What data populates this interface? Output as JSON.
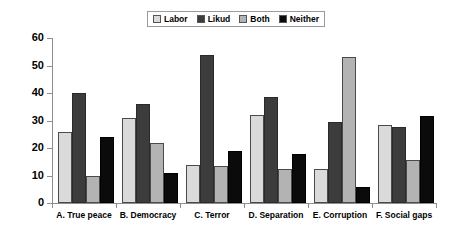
{
  "chart_data": {
    "type": "bar",
    "title": "",
    "xlabel": "",
    "ylabel": "",
    "ylim": [
      0,
      60
    ],
    "yticks": [
      0,
      10,
      20,
      30,
      40,
      50,
      60
    ],
    "grid": false,
    "legend_position": "top-center",
    "categories": [
      "A. True peace",
      "B. Democracy",
      "C. Terror",
      "D. Separation",
      "E. Corruption",
      "F. Social gaps"
    ],
    "series": [
      {
        "name": "Labor",
        "color": "#dadada",
        "values": [
          26,
          31,
          14,
          32,
          12.5,
          28.5
        ]
      },
      {
        "name": "Likud",
        "color": "#3c3c3c",
        "values": [
          40,
          36,
          54,
          38.5,
          29.5,
          27.5
        ]
      },
      {
        "name": "Both",
        "color": "#b3b3b3",
        "values": [
          10,
          22,
          13.5,
          12.5,
          53,
          15.5
        ]
      },
      {
        "name": "Neither",
        "color": "#0b0b0b",
        "values": [
          24,
          11,
          19,
          18,
          6,
          31.5
        ]
      }
    ]
  }
}
